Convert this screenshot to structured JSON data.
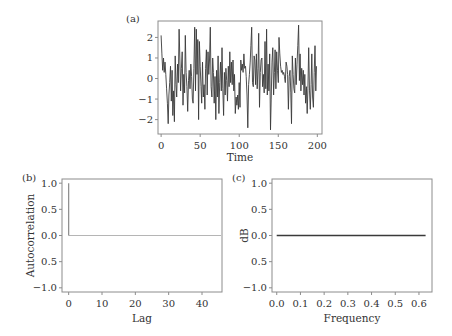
{
  "chart_data": [
    {
      "id": "a",
      "panel_label": "(a)",
      "type": "line",
      "title": "",
      "xlabel": "Time",
      "ylabel": "",
      "xlim": [
        -4,
        206
      ],
      "ylim": [
        -2.7,
        2.8
      ],
      "xticks": [
        0,
        50,
        100,
        150,
        200
      ],
      "xtick_labels": [
        "0",
        "50",
        "100",
        "150",
        "200"
      ],
      "yticks": [
        -2,
        -1,
        0,
        1,
        2
      ],
      "ytick_labels": [
        "−2",
        "−1",
        "0",
        "1",
        "2"
      ],
      "grid": false,
      "line_color": "#3a3a3a",
      "x": [
        0,
        1,
        2,
        3,
        4,
        5,
        6,
        7,
        8,
        9,
        10,
        11,
        12,
        13,
        14,
        15,
        16,
        17,
        18,
        19,
        20,
        21,
        22,
        23,
        24,
        25,
        26,
        27,
        28,
        29,
        30,
        31,
        32,
        33,
        34,
        35,
        36,
        37,
        38,
        39,
        40,
        41,
        42,
        43,
        44,
        45,
        46,
        47,
        48,
        49,
        50,
        51,
        52,
        53,
        54,
        55,
        56,
        57,
        58,
        59,
        60,
        61,
        62,
        63,
        64,
        65,
        66,
        67,
        68,
        69,
        70,
        71,
        72,
        73,
        74,
        75,
        76,
        77,
        78,
        79,
        80,
        81,
        82,
        83,
        84,
        85,
        86,
        87,
        88,
        89,
        90,
        91,
        92,
        93,
        94,
        95,
        96,
        97,
        98,
        99,
        100,
        101,
        102,
        103,
        104,
        105,
        106,
        107,
        108,
        109,
        110,
        111,
        112,
        113,
        114,
        115,
        116,
        117,
        118,
        119,
        120,
        121,
        122,
        123,
        124,
        125,
        126,
        127,
        128,
        129,
        130,
        131,
        132,
        133,
        134,
        135,
        136,
        137,
        138,
        139,
        140,
        141,
        142,
        143,
        144,
        145,
        146,
        147,
        148,
        149,
        150,
        151,
        152,
        153,
        154,
        155,
        156,
        157,
        158,
        159,
        160,
        161,
        162,
        163,
        164,
        165,
        166,
        167,
        168,
        169,
        170,
        171,
        172,
        173,
        174,
        175,
        176,
        177,
        178,
        179,
        180,
        181,
        182,
        183,
        184,
        185,
        186,
        187,
        188,
        189,
        190,
        191,
        192,
        193,
        194,
        195,
        196,
        197,
        198,
        199
      ],
      "values": [
        2.1,
        1.2,
        0.4,
        1.0,
        0.3,
        0.8,
        0.2,
        -0.5,
        -1.2,
        -2.2,
        -0.8,
        -0.2,
        0.6,
        -1.1,
        0.4,
        -1.8,
        -0.6,
        -2.1,
        1.1,
        -0.3,
        -0.9,
        0.7,
        -0.2,
        2.4,
        0.9,
        -0.6,
        0.5,
        1.3,
        -1.3,
        0.2,
        -0.7,
        2.1,
        0.3,
        -0.4,
        -1.6,
        -0.1,
        0.4,
        -0.5,
        0.7,
        0.1,
        -1.0,
        -1.2,
        0.5,
        2.5,
        -0.6,
        2.4,
        0.2,
        1.9,
        -2.0,
        1.8,
        0.6,
        -0.4,
        -1.2,
        0.8,
        -0.9,
        -0.3,
        -1.5,
        0.5,
        1.4,
        -0.8,
        1.3,
        0.2,
        0.9,
        2.5,
        -0.4,
        -0.9,
        1.0,
        0.3,
        -1.2,
        0.1,
        -2.0,
        0.4,
        -0.9,
        1.1,
        -1.7,
        -0.2,
        0.8,
        -0.6,
        1.5,
        -0.5,
        -1.8,
        0.3,
        -0.8,
        0.5,
        -0.1,
        -1.1,
        0.6,
        -0.4,
        1.3,
        -0.2,
        0.8,
        -0.3,
        0.9,
        -0.6,
        0.2,
        -1.7,
        -0.9,
        -1.3,
        -0.8,
        -1.5,
        -0.2,
        -1.4,
        0.9,
        0.4,
        0.7,
        0.3,
        1.2,
        0.5,
        0.6,
        0.1,
        -0.8,
        -2.4,
        -0.3,
        0.2,
        0.8,
        1.6,
        2.5,
        -0.2,
        -0.4,
        1.1,
        0.9,
        -0.3,
        1.2,
        -0.5,
        0.5,
        2.2,
        -1.4,
        0.3,
        0.9,
        1.0,
        -0.4,
        0.2,
        -0.7,
        1.8,
        -0.5,
        2.4,
        -0.8,
        0.7,
        -0.6,
        1.2,
        -2.5,
        -1.0,
        0.8,
        1.5,
        -0.8,
        0.3,
        1.4,
        -0.5,
        1.3,
        0.4,
        -0.2,
        2.0,
        1.2,
        0.6,
        0.3,
        0.4,
        0.2,
        0.3,
        0.1,
        -0.2,
        0.8,
        0.6,
        0.2,
        -1.5,
        0.1,
        0.4,
        -0.7,
        -2.2,
        1.1,
        0.2,
        -0.5,
        -0.7,
        1.0,
        -0.3,
        0.7,
        1.6,
        2.6,
        -0.1,
        1.2,
        -0.6,
        0.5,
        -0.3,
        0.4,
        -0.8,
        0.2,
        -1.2,
        -0.4,
        -1.7,
        -0.5,
        1.5,
        -0.6,
        -1.5,
        -0.3,
        1.2,
        -0.9,
        -1.4,
        0.3,
        1.6,
        -0.6,
        0.6,
        -0.7,
        0.4
      ]
    },
    {
      "id": "b",
      "panel_label": "(b)",
      "type": "bar",
      "title": "",
      "xlabel": "Lag",
      "ylabel": "Autocorrelation",
      "xlim": [
        -2,
        46
      ],
      "ylim": [
        -1.08,
        1.08
      ],
      "xticks": [
        0,
        10,
        20,
        30,
        40
      ],
      "xtick_labels": [
        "0",
        "10",
        "20",
        "30",
        "40"
      ],
      "yticks": [
        1.0,
        0.5,
        0.0,
        -0.5,
        -1.0
      ],
      "ytick_labels": [
        "1.0",
        "0.5",
        "0.0",
        "0.5",
        "−1.0"
      ],
      "grid": false,
      "line_color": "#8a8a8a",
      "stems": [
        {
          "lag": 0,
          "value": 1.0
        }
      ],
      "zero_line": {
        "from": 0,
        "to": 46,
        "value": 0.0,
        "color": "#b5b5b5"
      }
    },
    {
      "id": "c",
      "panel_label": "(c)",
      "type": "line",
      "title": "",
      "xlabel": "Frequency",
      "ylabel": "dB",
      "xlim": [
        -0.02,
        0.655
      ],
      "ylim": [
        -1.08,
        1.08
      ],
      "xticks": [
        0.0,
        0.1,
        0.2,
        0.3,
        0.4,
        0.5,
        0.6
      ],
      "xtick_labels": [
        "0.0",
        "0.1",
        "0.2",
        "0.3",
        "0.4",
        "0.5",
        "0.6"
      ],
      "yticks": [
        1.0,
        0.5,
        0.0,
        -0.5,
        -1.0
      ],
      "ytick_labels": [
        "1.0",
        "0.5",
        "0.0",
        "0.5",
        "−1.0"
      ],
      "grid": false,
      "line_color": "#3a3a3a",
      "x": [
        0.0,
        0.628
      ],
      "values": [
        0.0,
        0.0
      ]
    }
  ],
  "layout": {
    "panels": {
      "a": {
        "left": 158,
        "top": 21,
        "right": 322,
        "bottom": 134,
        "label_x": 126,
        "label_y": 22,
        "xlabel_y": 161,
        "tick_label_y": 149
      },
      "b": {
        "left": 62,
        "top": 179,
        "right": 222,
        "bottom": 292,
        "label_x": 22,
        "label_y": 181,
        "xlabel_y": 322,
        "tick_label_y": 307,
        "ylabel_x": 34
      },
      "c": {
        "left": 272,
        "top": 179,
        "right": 432,
        "bottom": 292,
        "label_x": 232,
        "label_y": 181,
        "xlabel_y": 322,
        "tick_label_y": 307,
        "ylabel_x": 248
      }
    },
    "frame_color": "#8c8c8c",
    "text_color": "#333333"
  }
}
